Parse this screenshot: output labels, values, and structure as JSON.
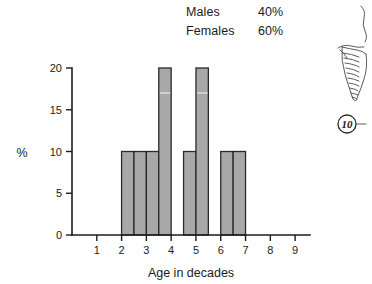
{
  "legend": {
    "rows": [
      {
        "label": "Males",
        "value": "40%"
      },
      {
        "label": "Females",
        "value": "60%"
      }
    ]
  },
  "figure_fragment": {
    "number_label": "10",
    "sketch_name": "ribcage-spine-sketch"
  },
  "chart_data": {
    "type": "bar",
    "title": "",
    "xlabel": "Age in decades",
    "ylabel": "%",
    "xlim": [
      0,
      9.6
    ],
    "ylim": [
      0,
      20
    ],
    "grid": false,
    "legend_position": "top-center",
    "x_ticks": [
      1,
      2,
      3,
      4,
      5,
      6,
      7,
      8,
      9
    ],
    "x_tick_labels": [
      "1",
      "2",
      "3",
      "4",
      "5",
      "6",
      "7",
      "8",
      "9"
    ],
    "y_ticks": [
      0,
      5,
      10,
      15,
      20
    ],
    "y_tick_labels": [
      "0",
      "5",
      "10",
      "15",
      "20"
    ],
    "bin_width": 0.5,
    "bins": [
      {
        "x0": 2.0,
        "x1": 2.5,
        "value": 10
      },
      {
        "x0": 2.5,
        "x1": 3.0,
        "value": 10
      },
      {
        "x0": 3.0,
        "x1": 3.5,
        "value": 10
      },
      {
        "x0": 3.5,
        "x1": 4.0,
        "value": 20
      },
      {
        "x0": 4.0,
        "x1": 4.5,
        "value": 0
      },
      {
        "x0": 4.5,
        "x1": 5.0,
        "value": 10
      },
      {
        "x0": 5.0,
        "x1": 5.5,
        "value": 20
      },
      {
        "x0": 5.5,
        "x1": 6.0,
        "value": 0
      },
      {
        "x0": 6.0,
        "x1": 6.5,
        "value": 10
      },
      {
        "x0": 6.5,
        "x1": 7.0,
        "value": 10
      }
    ],
    "bar_color": "#a8a8a8",
    "bar_edge_color": "#2a2a2a",
    "axis_color": "#1d1d1d"
  }
}
